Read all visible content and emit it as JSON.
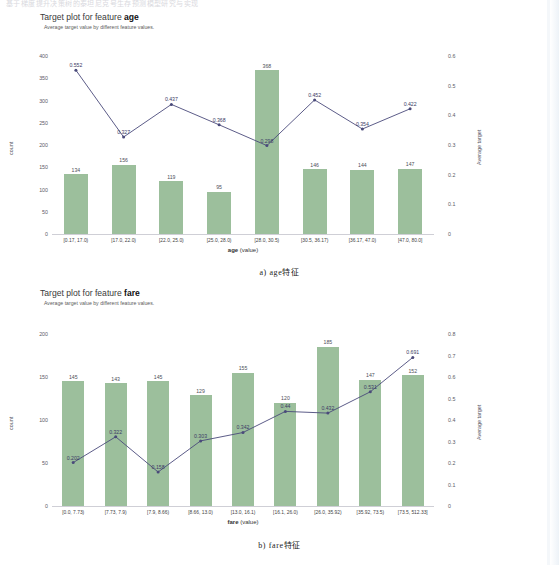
{
  "page": {
    "top_cut_text": "基于梯度提升决策树的泰坦尼克号生存预测模型研究与实现"
  },
  "figures": [
    {
      "id": "age",
      "title_prefix": "Target plot for feature ",
      "title_feature": "age",
      "subtitle": "Average target value by different feature values.",
      "caption": "a)  age特征",
      "xaxis_name_bold": "age",
      "xaxis_name_rest": " (value)",
      "yaxis_left_label": "count",
      "yaxis_right_label": "Average target",
      "chart_data": {
        "type": "bar",
        "title": "Target plot for feature age",
        "subtitle": "Average target value by different feature values.",
        "xlabel": "age (value)",
        "ylabel": "count",
        "y2label": "Average target",
        "grid": false,
        "legend": "none",
        "categories": [
          "[0.17, 17.0)",
          "[17.0, 22.0)",
          "[22.0, 25.0)",
          "[25.0, 28.0)",
          "[28.0, 30.5)",
          "[30.5, 36.17)",
          "[36.17, 47.0)",
          "[47.0, 80.0]"
        ],
        "series": [
          {
            "name": "count",
            "type": "bar",
            "axis": "left",
            "values": [
              134,
              156,
              119,
              95,
              368,
              146,
              144,
              147
            ]
          },
          {
            "name": "Average target",
            "type": "line",
            "axis": "right",
            "values": [
              0.552,
              0.327,
              0.437,
              0.368,
              0.298,
              0.452,
              0.354,
              0.422
            ]
          }
        ],
        "ylim": [
          0,
          400
        ],
        "yticks": [
          0,
          50,
          100,
          150,
          200,
          250,
          300,
          350,
          400
        ],
        "y2lim": [
          0,
          0.6
        ],
        "y2ticks": [
          "0",
          "0.1",
          "0.2",
          "0.3",
          "0.4",
          "0.5",
          "0.6"
        ]
      }
    },
    {
      "id": "fare",
      "title_prefix": "Target plot for feature ",
      "title_feature": "fare",
      "subtitle": "Average target value by different feature values.",
      "caption": "b)  fare特征",
      "xaxis_name_bold": "fare",
      "xaxis_name_rest": " (value)",
      "yaxis_left_label": "count",
      "yaxis_right_label": "Average target",
      "chart_data": {
        "type": "bar",
        "title": "Target plot for feature fare",
        "subtitle": "Average target value by different feature values.",
        "xlabel": "fare (value)",
        "ylabel": "count",
        "y2label": "Average target",
        "grid": false,
        "legend": "none",
        "categories": [
          "[0.0, 7.73)",
          "[7.73, 7.9)",
          "[7.9, 8.66)",
          "[8.66, 13.0)",
          "[13.0, 16.1)",
          "[16.1, 26.0)",
          "[26.0, 35.92)",
          "[35.92, 73.5)",
          "[73.5, 512.33]"
        ],
        "series": [
          {
            "name": "count",
            "type": "bar",
            "axis": "left",
            "values": [
              145,
              143,
              145,
              129,
              155,
              120,
              185,
              147,
              152
            ]
          },
          {
            "name": "Average target",
            "type": "line",
            "axis": "right",
            "values": [
              0.202,
              0.322,
              0.158,
              0.303,
              0.342,
              0.44,
              0.432,
              0.531,
              0.691
            ]
          }
        ],
        "ylim": [
          0,
          200
        ],
        "yticks": [
          0,
          50,
          100,
          150,
          200
        ],
        "y2lim": [
          0,
          0.8
        ],
        "y2ticks": [
          "0",
          "0.1",
          "0.2",
          "0.3",
          "0.4",
          "0.5",
          "0.6",
          "0.7",
          "0.8"
        ]
      }
    }
  ],
  "colors": {
    "bar": "#9cbf9c",
    "line": "#4a4a7a",
    "tick_text": "#5b5b66",
    "title_text": "#111111"
  }
}
